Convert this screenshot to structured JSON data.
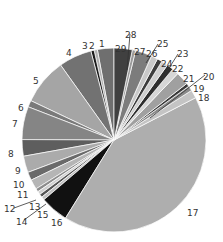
{
  "chart_data": {
    "type": "pie",
    "title": "",
    "start_angle_deg": 0,
    "direction": "counterclockwise",
    "center": [
      114,
      140
    ],
    "radius": 92,
    "slices": [
      {
        "label": "1",
        "value": 10,
        "color": "#6f6f6f"
      },
      {
        "label": "2",
        "value": 2,
        "color": "#b0b0b0"
      },
      {
        "label": "3",
        "value": 2,
        "color": "#1a1a1a"
      },
      {
        "label": "4",
        "value": 20,
        "color": "#727272"
      },
      {
        "label": "5",
        "value": 28,
        "color": "#a5a5a5"
      },
      {
        "label": "6",
        "value": 4,
        "color": "#7a7a7a"
      },
      {
        "label": "7",
        "value": 20,
        "color": "#858585"
      },
      {
        "label": "8",
        "value": 10,
        "color": "#5e5e5e"
      },
      {
        "label": "9",
        "value": 10,
        "color": "#ababab"
      },
      {
        "label": "10",
        "value": 5,
        "color": "#6a6a6a"
      },
      {
        "label": "11",
        "value": 6,
        "color": "#b5b5b5"
      },
      {
        "label": "12",
        "value": 2,
        "color": "#8c8c8c"
      },
      {
        "label": "13",
        "value": 2,
        "color": "#d0d0d0"
      },
      {
        "label": "14",
        "value": 2,
        "color": "#555555"
      },
      {
        "label": "15",
        "value": 2,
        "color": "#c0c0c0"
      },
      {
        "label": "16",
        "value": 17,
        "color": "#111111"
      },
      {
        "label": "17",
        "value": 143,
        "color": "#aeaeae"
      },
      {
        "label": "18",
        "value": 5,
        "color": "#c4c4c4"
      },
      {
        "label": "19",
        "value": 3,
        "color": "#8a8a8a"
      },
      {
        "label": "20",
        "value": 2,
        "color": "#3a3a3a"
      },
      {
        "label": "21",
        "value": 8,
        "color": "#a0a0a0"
      },
      {
        "label": "22",
        "value": 4,
        "color": "#d6d6d6"
      },
      {
        "label": "23",
        "value": 4,
        "color": "#2e2e2e"
      },
      {
        "label": "24",
        "value": 4,
        "color": "#cfcfcf"
      },
      {
        "label": "25",
        "value": 3,
        "color": "#3c3c3c"
      },
      {
        "label": "26",
        "value": 4,
        "color": "#c9c9c9"
      },
      {
        "label": "27",
        "value": 10,
        "color": "#7c7c7c"
      },
      {
        "label": "28",
        "value": 2,
        "color": "#9a9a9a"
      },
      {
        "label": "29",
        "value": 11,
        "color": "#404040"
      }
    ],
    "labels": [
      {
        "text": "1",
        "x": 99,
        "y": 47,
        "leader": null
      },
      {
        "text": "2",
        "x": 89,
        "y": 49,
        "leader": null
      },
      {
        "text": "3",
        "x": 82,
        "y": 49,
        "leader": null
      },
      {
        "text": "4",
        "x": 66,
        "y": 56,
        "leader": null
      },
      {
        "text": "5",
        "x": 33,
        "y": 84,
        "leader": null
      },
      {
        "text": "6",
        "x": 18,
        "y": 111,
        "leader": null
      },
      {
        "text": "7",
        "x": 12,
        "y": 127,
        "leader": null
      },
      {
        "text": "8",
        "x": 8,
        "y": 157,
        "leader": null
      },
      {
        "text": "9",
        "x": 15,
        "y": 174,
        "leader": null
      },
      {
        "text": "10",
        "x": 13,
        "y": 188,
        "leader": null
      },
      {
        "text": "11",
        "x": 17,
        "y": 198,
        "leader": null
      },
      {
        "text": "12",
        "x": 4,
        "y": 212,
        "leader": [
          14,
          208,
          36,
          200
        ]
      },
      {
        "text": "13",
        "x": 29,
        "y": 210,
        "leader": null
      },
      {
        "text": "14",
        "x": 16,
        "y": 225,
        "leader": [
          24,
          220,
          46,
          204
        ]
      },
      {
        "text": "15",
        "x": 37,
        "y": 218,
        "leader": null
      },
      {
        "text": "16",
        "x": 51,
        "y": 226,
        "leader": null
      },
      {
        "text": "17",
        "x": 187,
        "y": 216,
        "leader": null
      },
      {
        "text": "18",
        "x": 198,
        "y": 101,
        "leader": null
      },
      {
        "text": "19",
        "x": 193,
        "y": 92,
        "leader": null
      },
      {
        "text": "20",
        "x": 203,
        "y": 80,
        "leader": [
          205,
          75,
          150,
          118
        ]
      },
      {
        "text": "21",
        "x": 183,
        "y": 82,
        "leader": null
      },
      {
        "text": "22",
        "x": 172,
        "y": 72,
        "leader": null
      },
      {
        "text": "23",
        "x": 177,
        "y": 57,
        "leader": [
          178,
          54,
          162,
          79
        ]
      },
      {
        "text": "24",
        "x": 161,
        "y": 67,
        "leader": null
      },
      {
        "text": "25",
        "x": 157,
        "y": 47,
        "leader": [
          158,
          44,
          146,
          63
        ]
      },
      {
        "text": "26",
        "x": 146,
        "y": 57,
        "leader": null
      },
      {
        "text": "27",
        "x": 134,
        "y": 55,
        "leader": null
      },
      {
        "text": "28",
        "x": 125,
        "y": 38,
        "leader": [
          130,
          34,
          127,
          70
        ]
      },
      {
        "text": "29",
        "x": 115,
        "y": 52,
        "leader": null
      }
    ],
    "legend": null,
    "colors": {
      "background": "#ffffff",
      "separator": "#ffffff",
      "label": "#333333"
    }
  }
}
